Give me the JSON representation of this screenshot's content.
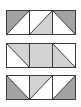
{
  "colors": {
    "dark": "#a3a3a3",
    "light": "#d3d3d3",
    "white": "#ffffff",
    "stroke": "#3a3a3a"
  },
  "rows": [
    {
      "name": "row-1",
      "cells": [
        {
          "type": "triangle",
          "filled": "upper-left",
          "fill": "dark",
          "diagonal": "bl-tr"
        },
        {
          "type": "triangle",
          "filled": "lower-right",
          "fill": "light",
          "diagonal": "bl-tr"
        },
        {
          "type": "triangle",
          "filled": "upper-right",
          "fill": "dark",
          "diagonal": "tl-br"
        }
      ]
    },
    {
      "name": "row-2",
      "cells": [
        {
          "type": "triangle",
          "filled": "upper-right",
          "fill": "light",
          "diagonal": "tl-br"
        },
        {
          "type": "full",
          "fill": "light"
        },
        {
          "type": "triangle",
          "filled": "lower-left",
          "fill": "light",
          "diagonal": "tl-br"
        }
      ]
    },
    {
      "name": "row-3",
      "cells": [
        {
          "type": "triangle",
          "filled": "lower-left",
          "fill": "dark",
          "diagonal": "tl-br"
        },
        {
          "type": "triangle",
          "filled": "upper-left",
          "fill": "light",
          "diagonal": "bl-tr"
        },
        {
          "type": "triangle",
          "filled": "lower-right",
          "fill": "dark",
          "diagonal": "bl-tr"
        }
      ]
    }
  ]
}
